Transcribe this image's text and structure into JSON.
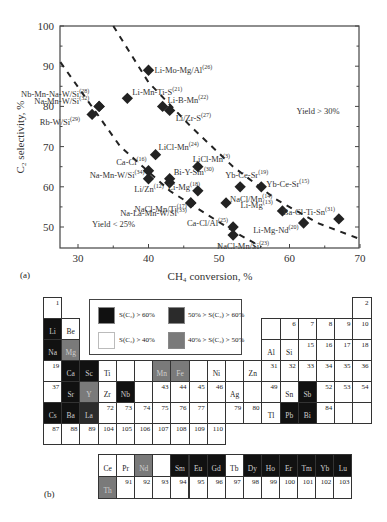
{
  "colors": {
    "black": "#111111",
    "darkgray": "#2b2b2b",
    "gray": "#7a7a7a",
    "white": "#ffffff"
  },
  "chart_data": [
    {
      "type": "scatter",
      "panel_label": "(a)",
      "xlabel": "CH4 conversion, %",
      "ylabel": "C2 selectivity, %",
      "xlim": [
        27.5,
        70
      ],
      "ylim": [
        45,
        100
      ],
      "xticks": [
        30,
        40,
        50,
        60,
        70
      ],
      "yticks": [
        50,
        60,
        70,
        80,
        90,
        100
      ],
      "annotations": [
        {
          "text": "Yield > 30%",
          "x": 61,
          "y": 78
        },
        {
          "text": "Yield < 25%",
          "x": 32,
          "y": 50
        }
      ],
      "lines": [
        {
          "name": "Yield 25% isoline",
          "style": "dashed",
          "points": [
            [
              27.5,
              91
            ],
            [
              36,
              70
            ],
            [
              43,
              59
            ],
            [
              52,
              49
            ],
            [
              56,
              45
            ]
          ]
        },
        {
          "name": "Yield 30% isoline",
          "style": "dashed",
          "points": [
            [
              35,
              100
            ],
            [
              40,
              86
            ],
            [
              46,
              75
            ],
            [
              52,
              65
            ],
            [
              58,
              57
            ],
            [
              64,
              51
            ],
            [
              70,
              47
            ]
          ]
        }
      ],
      "points": [
        {
          "label": "Li-Mo-Mg/Al",
          "ref": "26",
          "x": 40,
          "y": 89
        },
        {
          "label": "Nb-Mn-Na-W/Si",
          "ref": "28",
          "x": 33,
          "y": 80
        },
        {
          "label": "Na-Mn-W/Si",
          "ref": "32",
          "x": 33,
          "y": 80
        },
        {
          "label": "Li-Mn-Ti-S",
          "ref": "21",
          "x": 37,
          "y": 82
        },
        {
          "label": "Li-B-Mn",
          "ref": "22",
          "x": 42,
          "y": 80
        },
        {
          "label": "Li/Zr-S",
          "ref": "27",
          "x": 43,
          "y": 79
        },
        {
          "label": "Rb-W/Si",
          "ref": "29",
          "x": 32,
          "y": 78
        },
        {
          "label": "LiCl-Mn",
          "ref": "24",
          "x": 41,
          "y": 68
        },
        {
          "label": "LiCl-Mn",
          "ref": "3",
          "x": 47,
          "y": 65
        },
        {
          "label": "Ca-Cl",
          "ref": "16",
          "x": 40,
          "y": 64
        },
        {
          "label": "Na-Mn-W/Si",
          "ref": "34",
          "x": 40,
          "y": 62
        },
        {
          "label": "Bi-Y-Sm",
          "ref": "30",
          "x": 43,
          "y": 62
        },
        {
          "label": "Li/Zn",
          "ref": "12",
          "x": 43,
          "y": 61
        },
        {
          "label": "Li-Mg",
          "ref": "18",
          "x": 47,
          "y": 59
        },
        {
          "label": "NaCl-Mn/Ti",
          "ref": "17",
          "x": 46,
          "y": 56
        },
        {
          "label": "Yb-Ce-Sr",
          "ref": "19",
          "x": 53,
          "y": 60
        },
        {
          "label": "Yb-Ce-Sr",
          "ref": "15",
          "x": 56,
          "y": 60
        },
        {
          "label": "NaCl/Mn",
          "ref": "14",
          "x": 51,
          "y": 56
        },
        {
          "label": "Na-La-Mn-W/Si",
          "ref": "33",
          "x": 46,
          "y": 56
        },
        {
          "label": "Li-Mg",
          "ref": "13",
          "x": 59,
          "y": 54
        },
        {
          "label": "Ba-Cl-Ti-Sn",
          "ref": "31",
          "x": 67,
          "y": 52
        },
        {
          "label": "Ca-Cl/Al",
          "ref": "25",
          "x": 52,
          "y": 50
        },
        {
          "label": "NaCl-Mn/Si",
          "ref": "23",
          "x": 52,
          "y": 48
        },
        {
          "label": "Li-Mg-Nd",
          "ref": "20",
          "x": 62,
          "y": 51
        }
      ]
    },
    {
      "type": "table",
      "panel_label": "(b)",
      "title": "Periodic table shaded by C2 selectivity",
      "legend": [
        {
          "label": "S(C2) > 60%",
          "shade": "black"
        },
        {
          "label": "50% > S(C2) > 60%",
          "shade": "darkgray"
        },
        {
          "label": "S(C2) > 40%",
          "shade": "white"
        },
        {
          "label": "40% > S(C2) > 50%",
          "shade": "gray"
        }
      ]
    }
  ],
  "axis": {
    "y_label": "C₂ selectivity, %",
    "x_label": "CH₄ conversion, %"
  },
  "periodic_table": {
    "cells": [
      {
        "r": 0,
        "c": 0,
        "t": "1",
        "s": "white",
        "kind": "num"
      },
      {
        "r": 0,
        "c": 17,
        "t": "2",
        "s": "white",
        "kind": "num"
      },
      {
        "r": 1,
        "c": 0,
        "t": "Li",
        "s": "black",
        "kind": "sym"
      },
      {
        "r": 1,
        "c": 1,
        "t": "Be",
        "s": "white",
        "kind": "sym"
      },
      {
        "r": 1,
        "c": 12,
        "t": "",
        "s": "white",
        "kind": "num"
      },
      {
        "r": 1,
        "c": 13,
        "t": "6",
        "s": "white",
        "kind": "num"
      },
      {
        "r": 1,
        "c": 14,
        "t": "7",
        "s": "white",
        "kind": "num"
      },
      {
        "r": 1,
        "c": 15,
        "t": "8",
        "s": "white",
        "kind": "num"
      },
      {
        "r": 1,
        "c": 16,
        "t": "9",
        "s": "white",
        "kind": "num"
      },
      {
        "r": 1,
        "c": 17,
        "t": "10",
        "s": "white",
        "kind": "num"
      },
      {
        "r": 2,
        "c": 0,
        "t": "Na",
        "s": "black",
        "kind": "sym"
      },
      {
        "r": 2,
        "c": 1,
        "t": "Mg",
        "s": "gray",
        "kind": "sym"
      },
      {
        "r": 2,
        "c": 12,
        "t": "Al",
        "s": "white",
        "kind": "sym"
      },
      {
        "r": 2,
        "c": 13,
        "t": "Si",
        "s": "white",
        "kind": "sym"
      },
      {
        "r": 2,
        "c": 14,
        "t": "15",
        "s": "white",
        "kind": "num"
      },
      {
        "r": 2,
        "c": 15,
        "t": "16",
        "s": "white",
        "kind": "num"
      },
      {
        "r": 2,
        "c": 16,
        "t": "17",
        "s": "white",
        "kind": "num"
      },
      {
        "r": 2,
        "c": 17,
        "t": "18",
        "s": "white",
        "kind": "num"
      },
      {
        "r": 3,
        "c": 0,
        "t": "19",
        "s": "white",
        "kind": "num"
      },
      {
        "r": 3,
        "c": 1,
        "t": "Ca",
        "s": "black",
        "kind": "sym"
      },
      {
        "r": 3,
        "c": 2,
        "t": "Sc",
        "s": "black",
        "kind": "sym"
      },
      {
        "r": 3,
        "c": 3,
        "t": "Ti",
        "s": "white",
        "kind": "sym"
      },
      {
        "r": 3,
        "c": 4,
        "t": "",
        "s": "white",
        "kind": "num"
      },
      {
        "r": 3,
        "c": 5,
        "t": "",
        "s": "white",
        "kind": "num"
      },
      {
        "r": 3,
        "c": 6,
        "t": "Mn",
        "s": "gray",
        "kind": "sym"
      },
      {
        "r": 3,
        "c": 7,
        "t": "Fe",
        "s": "gray",
        "kind": "sym"
      },
      {
        "r": 3,
        "c": 8,
        "t": "",
        "s": "white",
        "kind": "num"
      },
      {
        "r": 3,
        "c": 9,
        "t": "Ni",
        "s": "white",
        "kind": "sym"
      },
      {
        "r": 3,
        "c": 10,
        "t": "",
        "s": "white",
        "kind": "num"
      },
      {
        "r": 3,
        "c": 11,
        "t": "Zn",
        "s": "white",
        "kind": "sym"
      },
      {
        "r": 3,
        "c": 12,
        "t": "31",
        "s": "white",
        "kind": "num"
      },
      {
        "r": 3,
        "c": 13,
        "t": "32",
        "s": "white",
        "kind": "num"
      },
      {
        "r": 3,
        "c": 14,
        "t": "33",
        "s": "white",
        "kind": "num"
      },
      {
        "r": 3,
        "c": 15,
        "t": "34",
        "s": "white",
        "kind": "num"
      },
      {
        "r": 3,
        "c": 16,
        "t": "35",
        "s": "white",
        "kind": "num"
      },
      {
        "r": 3,
        "c": 17,
        "t": "36",
        "s": "white",
        "kind": "num"
      },
      {
        "r": 4,
        "c": 0,
        "t": "37",
        "s": "white",
        "kind": "num"
      },
      {
        "r": 4,
        "c": 1,
        "t": "Sr",
        "s": "black",
        "kind": "sym"
      },
      {
        "r": 4,
        "c": 2,
        "t": "Y",
        "s": "gray",
        "kind": "sym"
      },
      {
        "r": 4,
        "c": 3,
        "t": "Zr",
        "s": "white",
        "kind": "sym"
      },
      {
        "r": 4,
        "c": 4,
        "t": "Nb",
        "s": "black",
        "kind": "sym"
      },
      {
        "r": 4,
        "c": 5,
        "t": "",
        "s": "white",
        "kind": "num"
      },
      {
        "r": 4,
        "c": 6,
        "t": "43",
        "s": "white",
        "kind": "num"
      },
      {
        "r": 4,
        "c": 7,
        "t": "44",
        "s": "white",
        "kind": "num"
      },
      {
        "r": 4,
        "c": 8,
        "t": "45",
        "s": "white",
        "kind": "num"
      },
      {
        "r": 4,
        "c": 9,
        "t": "46",
        "s": "white",
        "kind": "num"
      },
      {
        "r": 4,
        "c": 10,
        "t": "Ag",
        "s": "white",
        "kind": "sym"
      },
      {
        "r": 4,
        "c": 11,
        "t": "",
        "s": "white",
        "kind": "num"
      },
      {
        "r": 4,
        "c": 12,
        "t": "49",
        "s": "white",
        "kind": "num"
      },
      {
        "r": 4,
        "c": 13,
        "t": "Sn",
        "s": "white",
        "kind": "sym"
      },
      {
        "r": 4,
        "c": 14,
        "t": "Sb",
        "s": "black",
        "kind": "sym"
      },
      {
        "r": 4,
        "c": 15,
        "t": "52",
        "s": "white",
        "kind": "num"
      },
      {
        "r": 4,
        "c": 16,
        "t": "53",
        "s": "white",
        "kind": "num"
      },
      {
        "r": 4,
        "c": 17,
        "t": "54",
        "s": "white",
        "kind": "num"
      },
      {
        "r": 5,
        "c": 0,
        "t": "Cs",
        "s": "black",
        "kind": "sym"
      },
      {
        "r": 5,
        "c": 1,
        "t": "Ba",
        "s": "black",
        "kind": "sym"
      },
      {
        "r": 5,
        "c": 2,
        "t": "La",
        "s": "darkgray",
        "kind": "sym"
      },
      {
        "r": 5,
        "c": 3,
        "t": "72",
        "s": "white",
        "kind": "num"
      },
      {
        "r": 5,
        "c": 4,
        "t": "73",
        "s": "white",
        "kind": "num"
      },
      {
        "r": 5,
        "c": 5,
        "t": "74",
        "s": "white",
        "kind": "num"
      },
      {
        "r": 5,
        "c": 6,
        "t": "75",
        "s": "white",
        "kind": "num"
      },
      {
        "r": 5,
        "c": 7,
        "t": "76",
        "s": "white",
        "kind": "num"
      },
      {
        "r": 5,
        "c": 8,
        "t": "77",
        "s": "white",
        "kind": "num"
      },
      {
        "r": 5,
        "c": 9,
        "t": "",
        "s": "white",
        "kind": "num"
      },
      {
        "r": 5,
        "c": 10,
        "t": "79",
        "s": "white",
        "kind": "num"
      },
      {
        "r": 5,
        "c": 11,
        "t": "80",
        "s": "white",
        "kind": "num"
      },
      {
        "r": 5,
        "c": 12,
        "t": "Tl",
        "s": "white",
        "kind": "sym"
      },
      {
        "r": 5,
        "c": 13,
        "t": "Pb",
        "s": "black",
        "kind": "sym"
      },
      {
        "r": 5,
        "c": 14,
        "t": "Bi",
        "s": "black",
        "kind": "sym"
      },
      {
        "r": 5,
        "c": 15,
        "t": "84",
        "s": "white",
        "kind": "num"
      },
      {
        "r": 5,
        "c": 16,
        "t": "",
        "s": "white",
        "kind": "num"
      },
      {
        "r": 5,
        "c": 17,
        "t": "",
        "s": "white",
        "kind": "num"
      },
      {
        "r": 6,
        "c": 0,
        "t": "87",
        "s": "white",
        "kind": "num"
      },
      {
        "r": 6,
        "c": 1,
        "t": "88",
        "s": "white",
        "kind": "num"
      },
      {
        "r": 6,
        "c": 2,
        "t": "89",
        "s": "white",
        "kind": "num"
      },
      {
        "r": 6,
        "c": 3,
        "t": "104",
        "s": "white",
        "kind": "num"
      },
      {
        "r": 6,
        "c": 4,
        "t": "105",
        "s": "white",
        "kind": "num"
      },
      {
        "r": 6,
        "c": 5,
        "t": "106",
        "s": "white",
        "kind": "num"
      },
      {
        "r": 6,
        "c": 6,
        "t": "107",
        "s": "white",
        "kind": "num"
      },
      {
        "r": 6,
        "c": 7,
        "t": "108",
        "s": "white",
        "kind": "num"
      },
      {
        "r": 6,
        "c": 8,
        "t": "109",
        "s": "white",
        "kind": "num"
      },
      {
        "r": 6,
        "c": 9,
        "t": "110",
        "s": "white",
        "kind": "num"
      }
    ],
    "f_block": [
      {
        "r": 0,
        "c": 0,
        "t": "Ce",
        "s": "white",
        "kind": "sym"
      },
      {
        "r": 0,
        "c": 1,
        "t": "Pr",
        "s": "white",
        "kind": "sym"
      },
      {
        "r": 0,
        "c": 2,
        "t": "Nd",
        "s": "gray",
        "kind": "sym"
      },
      {
        "r": 0,
        "c": 3,
        "t": "",
        "s": "white",
        "kind": "num"
      },
      {
        "r": 0,
        "c": 4,
        "t": "Sm",
        "s": "black",
        "kind": "sym"
      },
      {
        "r": 0,
        "c": 5,
        "t": "Eu",
        "s": "black",
        "kind": "sym"
      },
      {
        "r": 0,
        "c": 6,
        "t": "Gd",
        "s": "black",
        "kind": "sym"
      },
      {
        "r": 0,
        "c": 7,
        "t": "Tb",
        "s": "white",
        "kind": "sym"
      },
      {
        "r": 0,
        "c": 8,
        "t": "Dy",
        "s": "black",
        "kind": "sym"
      },
      {
        "r": 0,
        "c": 9,
        "t": "Ho",
        "s": "black",
        "kind": "sym"
      },
      {
        "r": 0,
        "c": 10,
        "t": "Er",
        "s": "black",
        "kind": "sym"
      },
      {
        "r": 0,
        "c": 11,
        "t": "Tm",
        "s": "black",
        "kind": "sym"
      },
      {
        "r": 0,
        "c": 12,
        "t": "Yb",
        "s": "black",
        "kind": "sym"
      },
      {
        "r": 0,
        "c": 13,
        "t": "Lu",
        "s": "black",
        "kind": "sym"
      },
      {
        "r": 1,
        "c": 0,
        "t": "Th",
        "s": "gray",
        "kind": "sym"
      },
      {
        "r": 1,
        "c": 1,
        "t": "91",
        "s": "white",
        "kind": "num"
      },
      {
        "r": 1,
        "c": 2,
        "t": "92",
        "s": "white",
        "kind": "num"
      },
      {
        "r": 1,
        "c": 3,
        "t": "93",
        "s": "white",
        "kind": "num"
      },
      {
        "r": 1,
        "c": 4,
        "t": "94",
        "s": "white",
        "kind": "num"
      },
      {
        "r": 1,
        "c": 5,
        "t": "95",
        "s": "white",
        "kind": "num"
      },
      {
        "r": 1,
        "c": 6,
        "t": "96",
        "s": "white",
        "kind": "num"
      },
      {
        "r": 1,
        "c": 7,
        "t": "97",
        "s": "white",
        "kind": "num"
      },
      {
        "r": 1,
        "c": 8,
        "t": "98",
        "s": "white",
        "kind": "num"
      },
      {
        "r": 1,
        "c": 9,
        "t": "99",
        "s": "white",
        "kind": "num"
      },
      {
        "r": 1,
        "c": 10,
        "t": "100",
        "s": "white",
        "kind": "num"
      },
      {
        "r": 1,
        "c": 11,
        "t": "101",
        "s": "white",
        "kind": "num"
      },
      {
        "r": 1,
        "c": 12,
        "t": "102",
        "s": "white",
        "kind": "num"
      },
      {
        "r": 1,
        "c": 13,
        "t": "103",
        "s": "white",
        "kind": "num"
      }
    ]
  },
  "legend": {
    "items": [
      {
        "label": "S(C₂) > 60%",
        "shade": "black"
      },
      {
        "label": "50% > S(C₂) > 60%",
        "shade": "darkgray"
      },
      {
        "label": "S(C₂) > 40%",
        "shade": "white"
      },
      {
        "label": "40% > S(C₂) > 50%",
        "shade": "gray"
      }
    ]
  },
  "captions": {
    "a": "(a)",
    "b": "(b)"
  }
}
